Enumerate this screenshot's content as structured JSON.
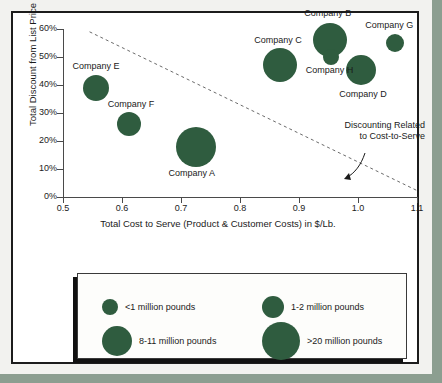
{
  "chart_data": {
    "type": "scatter",
    "title": "",
    "xlabel": "Total Cost to Serve (Product & Customer Costs) in $/Lb.",
    "ylabel": "Total Discount from List Price",
    "xlim": [
      0.5,
      1.1
    ],
    "ylim": [
      0,
      60
    ],
    "grid": false,
    "x_ticks": [
      "0.5",
      "0.6",
      "0.7",
      "0.8",
      "0.9",
      "1.0",
      "1.1"
    ],
    "x_tick_values": [
      0.5,
      0.6,
      0.7,
      0.8,
      0.9,
      1.0,
      1.1
    ],
    "y_ticks": [
      "0%",
      "10%",
      "20%",
      "30%",
      "40%",
      "50%",
      "60%"
    ],
    "y_tick_values": [
      0,
      10,
      20,
      30,
      40,
      50,
      60
    ],
    "bubble_color": "#2f5c3f",
    "points": [
      {
        "label": "Company A",
        "x": 0.725,
        "y": 18,
        "size": "8-11 million pounds",
        "r": 20,
        "label_dx": -4,
        "label_dy": 26
      },
      {
        "label": "Company B",
        "x": 0.952,
        "y": 56,
        "size": "8-11 million pounds",
        "r": 17,
        "label_dx": -2,
        "label_dy": -27
      },
      {
        "label": "Company C",
        "x": 0.868,
        "y": 47,
        "size": "8-11 million pounds",
        "r": 17,
        "label_dx": -2,
        "label_dy": -25
      },
      {
        "label": "Company D",
        "x": 1.005,
        "y": 45.5,
        "size": "8-11 million pounds",
        "r": 15,
        "label_dx": 2,
        "label_dy": 24
      },
      {
        "label": "Company E",
        "x": 0.556,
        "y": 39,
        "size": "1-2 million pounds",
        "r": 13,
        "label_dx": 0,
        "label_dy": -22
      },
      {
        "label": "Company F",
        "x": 0.612,
        "y": 26,
        "size": "1-2 million pounds",
        "r": 12,
        "label_dx": 2,
        "label_dy": -20
      },
      {
        "label": "Company G",
        "x": 1.063,
        "y": 55,
        "size": "<1 million pounds",
        "r": 9,
        "label_dx": -6,
        "label_dy": -18
      },
      {
        "label": "Company H",
        "x": 0.955,
        "y": 50,
        "size": "<1 million pounds",
        "r": 8,
        "label_dx": -2,
        "label_dy": 13
      }
    ],
    "trendline": {
      "style": "dashed",
      "color": "#6b6b6b",
      "x_start": 0.545,
      "y_start": 59,
      "x_end": 1.103,
      "y_end": 2
    },
    "annotation": {
      "line1": "Discounting Related",
      "line2": "to Cost-to-Serve"
    },
    "legend": {
      "position": "below-plot",
      "entries": [
        {
          "label": "<1 million pounds",
          "r": 8
        },
        {
          "label": "1-2 million pounds",
          "r": 11
        },
        {
          "label": "8-11 million pounds",
          "r": 15
        },
        {
          "label": ">20 million pounds",
          "r": 19
        }
      ]
    }
  }
}
